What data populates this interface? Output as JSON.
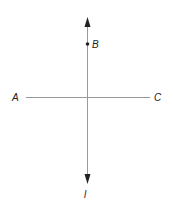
{
  "diagram": {
    "labels": {
      "A": "A",
      "B": "B",
      "C": "C",
      "l": "l"
    },
    "colors": {
      "line": "#888888",
      "arrow": "#222222",
      "point": "#222222",
      "text": "#222222"
    }
  }
}
